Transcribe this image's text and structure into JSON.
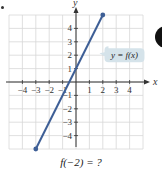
{
  "chart_data": {
    "type": "line",
    "title": "",
    "xlabel": "x",
    "ylabel": "y",
    "xlim": [
      -5,
      5
    ],
    "ylim": [
      -5,
      5
    ],
    "grid": true,
    "x_ticks": [
      -4,
      -3,
      -2,
      -1,
      1,
      2,
      3,
      4
    ],
    "y_ticks": [
      -4,
      -3,
      -2,
      -1,
      1,
      2,
      3,
      4
    ],
    "series": [
      {
        "name": "y = f(x)",
        "color": "#3e5f96",
        "x": [
          -3,
          2
        ],
        "y": [
          -5,
          5
        ],
        "endpoints": "closed"
      }
    ],
    "annotations": [
      {
        "text": "y = f(x)",
        "x": 2.2,
        "y": 2,
        "style": "callout"
      }
    ]
  },
  "labels": {
    "x_axis": "x",
    "y_axis": "y",
    "curve": "y = f(x)",
    "question": "f(−2) = ?"
  },
  "colors": {
    "line": "#3e5f96",
    "grid": "#d8d8d8",
    "axis": "#333333",
    "callout_bg": "#d5e3ea"
  }
}
